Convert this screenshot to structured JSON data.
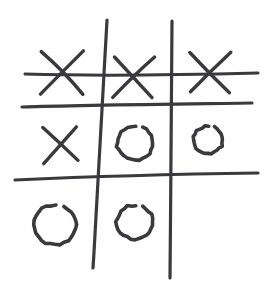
{
  "app": {
    "title": "Tic Tac Toe",
    "surface_color": "#ffffff",
    "ink_color": "#3a3a3c"
  },
  "board": {
    "label": "tic-tac-toe-board",
    "rows": 3,
    "columns": 3,
    "cells": [
      {
        "id": "cell-top-left",
        "row": 0,
        "col": 0,
        "mark": "X",
        "mark_name": "x-mark",
        "cx": 62,
        "cy": 73,
        "size": 21
      },
      {
        "id": "cell-top-center",
        "row": 0,
        "col": 1,
        "mark": "X",
        "mark_name": "x-mark",
        "cx": 133,
        "cy": 76,
        "size": 20
      },
      {
        "id": "cell-top-right",
        "row": 0,
        "col": 2,
        "mark": "X",
        "mark_name": "x-mark",
        "cx": 210,
        "cy": 72,
        "size": 20
      },
      {
        "id": "cell-middle-left",
        "row": 1,
        "col": 0,
        "mark": "X",
        "mark_name": "x-mark",
        "cx": 61,
        "cy": 145,
        "size": 17
      },
      {
        "id": "cell-middle-center",
        "row": 1,
        "col": 1,
        "mark": "O",
        "mark_name": "o-mark",
        "cx": 135,
        "cy": 143,
        "size": 17
      },
      {
        "id": "cell-middle-right",
        "row": 1,
        "col": 2,
        "mark": "O",
        "mark_name": "o-mark",
        "cx": 208,
        "cy": 140,
        "size": 14
      },
      {
        "id": "cell-bottom-left",
        "row": 2,
        "col": 0,
        "mark": "O",
        "mark_name": "o-mark",
        "cx": 55,
        "cy": 225,
        "size": 20
      },
      {
        "id": "cell-bottom-center",
        "row": 2,
        "col": 1,
        "mark": "O",
        "mark_name": "o-mark",
        "cx": 135,
        "cy": 222,
        "size": 17
      },
      {
        "id": "cell-bottom-right",
        "row": 2,
        "col": 2,
        "mark": "",
        "mark_name": "empty-cell",
        "cx": 210,
        "cy": 222,
        "size": 0
      }
    ],
    "board_state": [
      [
        "X",
        "X",
        "X"
      ],
      [
        "X",
        "O",
        "O"
      ],
      [
        "O",
        "O",
        ""
      ]
    ],
    "winner": "X",
    "winning_line": "top-row",
    "win_stroke_label": "win-strike-through"
  },
  "strokes": {
    "grid_vertical_1": "M 107,20 C 104,80 99,175 93,268",
    "grid_vertical_2": "M 172,21 C 171,90 171,190 170,278",
    "grid_horizontal_1": "M 22,107 C 80,105 180,104 252,103",
    "grid_horizontal_2": "M 15,180 C 80,177 185,174 258,173",
    "win_strike": "M 25,74 C 90,76 180,75 258,73",
    "x_stroke_1": "M -1,-1 L 1,1",
    "x_stroke_2": "M 1,-1 L -1,1"
  },
  "legend": {
    "x_label": "X",
    "o_label": "O",
    "empty_label": ""
  }
}
